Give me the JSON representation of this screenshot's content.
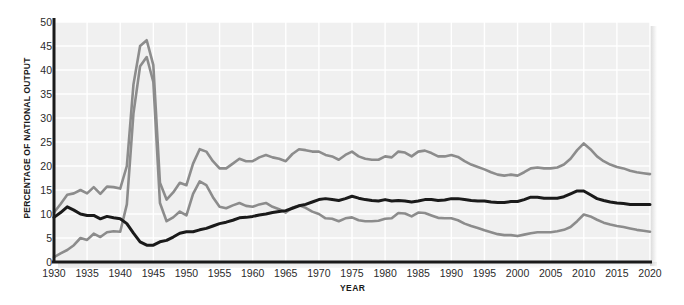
{
  "chart_data": {
    "type": "line",
    "title": "",
    "xlabel": "YEAR",
    "ylabel": "PERCENTAGE OF NATIONAL OUTPUT",
    "xlim": [
      1930,
      2020
    ],
    "ylim": [
      0,
      50
    ],
    "xticks": [
      1930,
      1935,
      1940,
      1945,
      1950,
      1955,
      1960,
      1965,
      1970,
      1975,
      1980,
      1985,
      1990,
      1995,
      2000,
      2005,
      2010,
      2015,
      2020
    ],
    "yticks": [
      0,
      5,
      10,
      15,
      20,
      25,
      30,
      35,
      40,
      45,
      50
    ],
    "grid": true,
    "legend_position": "inline-annotations",
    "x": [
      1930,
      1931,
      1932,
      1933,
      1934,
      1935,
      1936,
      1937,
      1938,
      1939,
      1940,
      1941,
      1942,
      1943,
      1944,
      1945,
      1946,
      1947,
      1948,
      1949,
      1950,
      1951,
      1952,
      1953,
      1954,
      1955,
      1956,
      1957,
      1958,
      1959,
      1960,
      1961,
      1962,
      1963,
      1964,
      1965,
      1966,
      1967,
      1968,
      1969,
      1970,
      1971,
      1972,
      1973,
      1974,
      1975,
      1976,
      1977,
      1978,
      1979,
      1980,
      1981,
      1982,
      1983,
      1984,
      1985,
      1986,
      1987,
      1988,
      1989,
      1990,
      1991,
      1992,
      1993,
      1994,
      1995,
      1996,
      1997,
      1998,
      1999,
      2000,
      2001,
      2002,
      2003,
      2004,
      2005,
      2006,
      2007,
      2008,
      2009,
      2010,
      2011,
      2012,
      2013,
      2014,
      2015,
      2016,
      2017,
      2018,
      2019,
      2020
    ],
    "series": [
      {
        "name": "Total government purchases",
        "color": "#8c8c8c",
        "values": [
          10.3,
          12.1,
          14.0,
          14.3,
          15.0,
          14.3,
          15.6,
          14.2,
          15.7,
          15.6,
          15.3,
          20.0,
          37.0,
          45.0,
          46.2,
          41.0,
          16.5,
          13.0,
          14.5,
          16.5,
          16.0,
          20.5,
          23.5,
          23.0,
          21.0,
          19.5,
          19.5,
          20.5,
          21.5,
          21.0,
          21.0,
          21.8,
          22.3,
          21.8,
          21.5,
          21.0,
          22.5,
          23.5,
          23.3,
          23.0,
          23.0,
          22.3,
          22.0,
          21.3,
          22.3,
          23.0,
          22.0,
          21.5,
          21.3,
          21.3,
          22.0,
          21.8,
          23.0,
          22.8,
          22.0,
          23.0,
          23.2,
          22.7,
          22.0,
          22.0,
          22.3,
          21.9,
          21.0,
          20.3,
          19.8,
          19.3,
          18.7,
          18.2,
          18.0,
          18.2,
          18.0,
          18.7,
          19.5,
          19.7,
          19.5,
          19.5,
          19.7,
          20.3,
          21.5,
          23.3,
          24.7,
          23.5,
          22.0,
          21.0,
          20.3,
          19.8,
          19.5,
          19.0,
          18.7,
          18.5,
          18.3
        ]
      },
      {
        "name": "State and local purchases",
        "color": "#1a1a1a",
        "values": [
          9.3,
          10.3,
          11.5,
          10.8,
          10.0,
          9.7,
          9.7,
          9.0,
          9.5,
          9.2,
          9.0,
          8.0,
          6.0,
          4.2,
          3.5,
          3.5,
          4.2,
          4.5,
          5.2,
          6.0,
          6.3,
          6.3,
          6.7,
          7.0,
          7.5,
          8.0,
          8.3,
          8.7,
          9.2,
          9.3,
          9.5,
          9.8,
          10.0,
          10.3,
          10.5,
          10.7,
          11.2,
          11.7,
          12.0,
          12.5,
          13.0,
          13.2,
          13.0,
          12.8,
          13.2,
          13.7,
          13.3,
          13.0,
          12.8,
          12.7,
          13.0,
          12.7,
          12.8,
          12.7,
          12.5,
          12.7,
          13.0,
          13.0,
          12.8,
          12.9,
          13.2,
          13.2,
          13.0,
          12.8,
          12.7,
          12.7,
          12.5,
          12.4,
          12.4,
          12.6,
          12.6,
          13.0,
          13.5,
          13.5,
          13.3,
          13.3,
          13.3,
          13.6,
          14.2,
          14.8,
          14.8,
          14.0,
          13.2,
          12.8,
          12.5,
          12.3,
          12.2,
          12.0,
          12.0,
          12.0,
          12.0
        ]
      },
      {
        "name": "Federal purchases",
        "color": "#8c8c8c",
        "values": [
          1.0,
          1.8,
          2.5,
          3.5,
          5.0,
          4.6,
          5.9,
          5.2,
          6.2,
          6.4,
          6.3,
          12.0,
          31.0,
          40.8,
          42.7,
          37.5,
          12.3,
          8.5,
          9.3,
          10.5,
          9.7,
          14.2,
          16.8,
          16.0,
          13.5,
          11.5,
          11.2,
          11.8,
          12.3,
          11.7,
          11.5,
          12.0,
          12.3,
          11.5,
          11.0,
          10.3,
          11.3,
          11.8,
          11.3,
          10.5,
          10.0,
          9.1,
          9.0,
          8.5,
          9.1,
          9.3,
          8.7,
          8.5,
          8.5,
          8.6,
          9.0,
          9.1,
          10.2,
          10.1,
          9.5,
          10.3,
          10.2,
          9.7,
          9.2,
          9.1,
          9.1,
          8.7,
          8.0,
          7.5,
          7.1,
          6.6,
          6.2,
          5.8,
          5.6,
          5.6,
          5.4,
          5.7,
          6.0,
          6.2,
          6.2,
          6.2,
          6.4,
          6.7,
          7.3,
          8.5,
          9.9,
          9.5,
          8.8,
          8.2,
          7.8,
          7.5,
          7.3,
          7.0,
          6.7,
          6.5,
          6.3
        ]
      }
    ],
    "annotations": [
      {
        "text": "Total government purchases",
        "x": 1971,
        "y": 24.8
      },
      {
        "text": "State and local purchases",
        "x": 1977,
        "y": 16.0
      },
      {
        "text": "Federal purchases",
        "x": 1982,
        "y": 7.6
      }
    ]
  },
  "style": {
    "plot_bg": "#f0f0f0",
    "gridline_color": "#ffffff",
    "axis_color": "#1a1a1a",
    "page_bg": "#ffffff"
  }
}
